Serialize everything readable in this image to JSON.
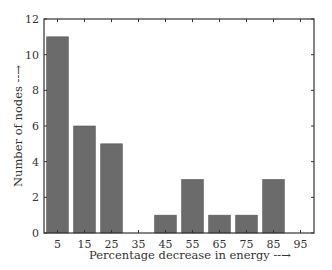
{
  "chart_data": {
    "type": "bar",
    "title": "",
    "xlabel": "Percentage decrease in energy --→",
    "ylabel": "Number of nodes --→",
    "categories": [
      "5",
      "15",
      "25",
      "35",
      "45",
      "55",
      "65",
      "75",
      "85",
      "95"
    ],
    "x": [
      5,
      15,
      25,
      35,
      45,
      55,
      65,
      75,
      85,
      95
    ],
    "values": [
      11,
      6,
      5,
      0,
      1,
      3,
      1,
      1,
      3,
      0
    ],
    "xlim": [
      0,
      100
    ],
    "ylim": [
      0,
      12
    ],
    "yticks": [
      0,
      2,
      4,
      6,
      8,
      10,
      12
    ],
    "xticks": [
      5,
      15,
      25,
      35,
      45,
      55,
      65,
      75,
      85,
      95
    ],
    "grid": false,
    "legend": null,
    "bar_color": "#6b6b6b"
  }
}
